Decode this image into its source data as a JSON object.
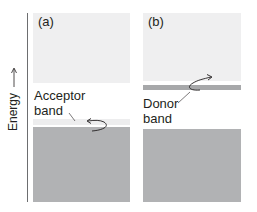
{
  "axis": {
    "label": "Energy",
    "arrow": "up-arrow"
  },
  "panels": [
    {
      "id": "a",
      "label": "(a)",
      "band_label_line1": "Acceptor",
      "band_label_line2": "band",
      "band_type": "acceptor",
      "band_position": "just above valence band"
    },
    {
      "id": "b",
      "label": "(b)",
      "band_label_line1": "Donor",
      "band_label_line2": "band",
      "band_type": "donor",
      "band_position": "just below conduction band"
    }
  ],
  "colors": {
    "conduction_band": "#efeff0",
    "valence_band": "#b1b2b4",
    "acceptor_band": "#ededee",
    "donor_band": "#a7a8aa",
    "axis": "#6d6e70",
    "text": "#231f20"
  }
}
